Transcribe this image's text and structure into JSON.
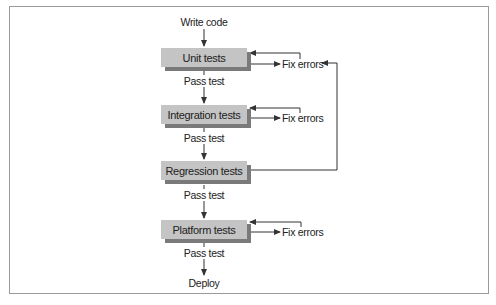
{
  "diagram": {
    "start": "Write code",
    "end": "Deploy",
    "stages": [
      {
        "label": "Unit tests",
        "pass_label": "Pass test",
        "fail_label": "Fix errors"
      },
      {
        "label": "Integration tests",
        "pass_label": "Pass test",
        "fail_label": "Fix errors"
      },
      {
        "label": "Regression tests",
        "pass_label": "Pass test",
        "fail_label": null
      },
      {
        "label": "Platform tests",
        "pass_label": "Pass test",
        "fail_label": "Fix errors"
      }
    ],
    "regression_feedback_target": "Fix errors (Unit tests)",
    "colors": {
      "box_fill": "#c4c4c4",
      "box_shadow": "#7a7a7a",
      "line": "#333333",
      "frame": "#9a9a9a"
    }
  }
}
